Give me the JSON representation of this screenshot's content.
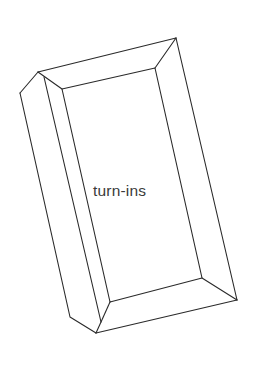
{
  "diagram": {
    "title": "",
    "label": "turn-ins",
    "stroke_color": "#2a2a2a",
    "text_color": "#3a3a3a",
    "background": "#ffffff"
  }
}
